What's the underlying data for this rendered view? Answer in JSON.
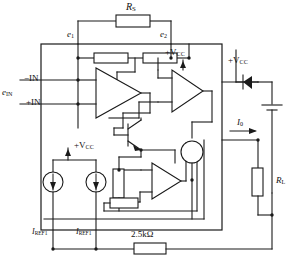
{
  "diagram": {
    "type": "electronic-schematic"
  },
  "labels": {
    "rs": "R",
    "rs_sub": "S",
    "e1": "e",
    "e1_sub": "1",
    "e2": "e",
    "e2_sub": "2",
    "ein": "e",
    "ein_sub": "IN",
    "minus_in": "−IN",
    "plus_in": "+IN",
    "vcc_mid": "+V",
    "vcc_mid_sub": "CC",
    "vcc_right": "+V",
    "vcc_right_sub": "CC",
    "vcc_low": "+V",
    "vcc_low_sub": "CC",
    "iref1_left": "I",
    "iref1_left_sub": "REF1",
    "iref1_right": "I",
    "iref1_right_sub": "REF1",
    "resistor_bottom": "2.5kΩ",
    "io": "I",
    "io_sub": "0",
    "rl": "R",
    "rl_sub": "L"
  },
  "components": {
    "opamp_input": "input-differential-amplifier",
    "opamp_output": "output-buffer-amplifier",
    "opamp_lower": "current-sense-amplifier",
    "transistor": "npn-transistor",
    "diode": "supply-diode",
    "battery": "supply-battery",
    "current_source_1": "reference-current-source",
    "current_source_2": "reference-current-source",
    "current_source_3": "output-current-source",
    "resistor_feedback_rs": "feedback-resistor-rs",
    "resistor_bias_left": "bias-resistor-left",
    "resistor_bias_right": "bias-resistor-right",
    "resistor_sense_vertical": "sense-resistor-vertical",
    "resistor_sense_horizontal": "sense-resistor-horizontal",
    "resistor_load": "load-resistor-rl",
    "resistor_gain_25k": "gain-set-resistor-2k5"
  },
  "colors": {
    "line": "#1a1a1a",
    "background": "#ffffff",
    "text": "#111111"
  }
}
